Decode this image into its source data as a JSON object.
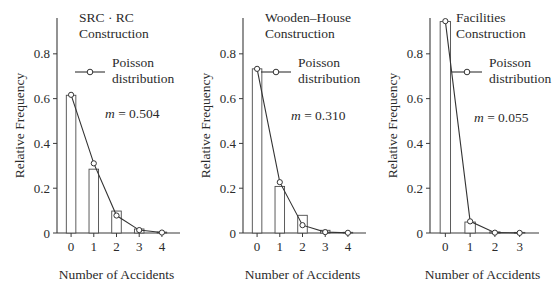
{
  "figure": {
    "panel_count": 3,
    "background_color": "#ffffff",
    "ink_color": "#2b2b2b"
  },
  "chart_data": [
    {
      "type": "bar",
      "title": "SRC · RC Construction",
      "title_lines": [
        "SRC · RC",
        "Construction"
      ],
      "xlabel": "Number of Accidents",
      "ylabel": "Relative Frequency",
      "categories": [
        "0",
        "1",
        "2",
        "3",
        "4"
      ],
      "x": [
        0,
        1,
        2,
        3,
        4
      ],
      "values": [
        0.615,
        0.285,
        0.098,
        0.018,
        0.004
      ],
      "series": [
        {
          "name": "Poisson distribution",
          "values": [
            0.617,
            0.311,
            0.078,
            0.013,
            0.002
          ]
        }
      ],
      "legend_label_lines": [
        "Poisson",
        "distribution"
      ],
      "legend_position": "upper-right",
      "annotation": "m = 0.504",
      "annotation_symbol": "m",
      "annotation_value": "0.504",
      "ylim": [
        0,
        0.96
      ],
      "yticks": [
        0,
        0.2,
        0.4,
        0.6,
        0.8
      ],
      "ytick_labels": [
        "0",
        "0.2",
        "0.4",
        "0.6",
        "0.8"
      ],
      "xlim": [
        -0.62,
        4.62
      ],
      "grid": false
    },
    {
      "type": "bar",
      "title": "Wooden-House Construction",
      "title_lines": [
        "Wooden–House",
        "Construction"
      ],
      "xlabel": "Number of Accidents",
      "ylabel": "Relative Frequency",
      "categories": [
        "0",
        "1",
        "2",
        "3",
        "4"
      ],
      "x": [
        0,
        1,
        2,
        3,
        4
      ],
      "values": [
        0.733,
        0.208,
        0.079,
        0.012,
        0.003
      ],
      "series": [
        {
          "name": "Poisson distribution",
          "values": [
            0.733,
            0.227,
            0.035,
            0.004,
            0.001
          ]
        }
      ],
      "legend_label_lines": [
        "Poisson",
        "distribution"
      ],
      "legend_position": "upper-right",
      "annotation": "m = 0.310",
      "annotation_symbol": "m",
      "annotation_value": "0.310",
      "ylim": [
        0,
        0.96
      ],
      "yticks": [
        0,
        0.2,
        0.4,
        0.6,
        0.8
      ],
      "ytick_labels": [
        "0",
        "0.2",
        "0.4",
        "0.6",
        "0.8"
      ],
      "xlim": [
        -0.62,
        4.62
      ],
      "grid": false
    },
    {
      "type": "bar",
      "title": "Facilities Construction",
      "title_lines": [
        "Facilities",
        "Construction"
      ],
      "xlabel": "Number of Accidents",
      "ylabel": "Relative Frequency",
      "categories": [
        "0",
        "1",
        "2",
        "3"
      ],
      "x": [
        0,
        1,
        2,
        3
      ],
      "values": [
        0.944,
        0.049,
        0.005,
        0.002
      ],
      "series": [
        {
          "name": "Poisson distribution",
          "values": [
            0.946,
            0.052,
            0.0015,
            0.0005
          ]
        }
      ],
      "legend_label_lines": [
        "Poisson",
        "distribution"
      ],
      "legend_position": "upper-right",
      "annotation": "m = 0.055",
      "annotation_symbol": "m",
      "annotation_value": "0.055",
      "ylim": [
        0,
        0.96
      ],
      "yticks": [
        0,
        0.2,
        0.4,
        0.6,
        0.8
      ],
      "ytick_labels": [
        "0",
        "0.2",
        "0.4",
        "0.6",
        "0.8"
      ],
      "xlim": [
        -0.62,
        3.62
      ],
      "grid": false
    }
  ]
}
